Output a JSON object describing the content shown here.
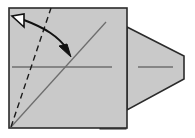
{
  "figure": {
    "canvas": {
      "width": 195,
      "height": 138,
      "background": "#ffffff"
    },
    "colors": {
      "paper_fill": "#c9c9c9",
      "paper_fill_light": "#cfcfcf",
      "outline": "#2b2b2b",
      "crease_line": "#6e6e6e",
      "dashed_line": "#1a1a1a",
      "arrow_stroke": "#111111",
      "arrow_fill": "#ffffff",
      "shadow": "#8a8a8a"
    },
    "shapes": [
      {
        "name": "paper-square",
        "type": "rect",
        "label": "Main square sheet",
        "x": 9,
        "y": 8,
        "width": 118,
        "height": 120,
        "fill": "#c9c9c9",
        "stroke": "#2b2b2b",
        "stroke_width": 1.6
      },
      {
        "name": "paper-point-flap",
        "type": "polygon",
        "label": "Pointed flap extending right",
        "points": "127,27 184,56 184,79 127,110",
        "fill": "#c9c9c9",
        "stroke": "#2b2b2b",
        "stroke_width": 1.6
      },
      {
        "name": "bottom-tab",
        "type": "rect",
        "label": "Small tab along bottom edge",
        "x": 100,
        "y": 124,
        "width": 26,
        "height": 5,
        "fill": "#6e6e6e",
        "stroke": "#2b2b2b",
        "stroke_width": 1.0
      }
    ],
    "lines": [
      {
        "name": "horizontal-center-crease",
        "label": "Horizontal centre crease on square",
        "x1": 12,
        "y1": 67,
        "x2": 112,
        "y2": 67,
        "stroke": "#6e6e6e",
        "stroke_width": 1.3,
        "style": "solid"
      },
      {
        "name": "flap-center-crease",
        "label": "Horizontal centre crease on flap",
        "x1": 138,
        "y1": 67,
        "x2": 173,
        "y2": 67,
        "stroke": "#6e6e6e",
        "stroke_width": 1.3,
        "style": "solid"
      },
      {
        "name": "diagonal-crease",
        "label": "Solid diagonal crease bottom-left to top-right",
        "x1": 11,
        "y1": 127,
        "x2": 106,
        "y2": 22,
        "stroke": "#6e6e6e",
        "stroke_width": 1.3,
        "style": "solid"
      },
      {
        "name": "dashed-fold-line",
        "label": "Dashed valley fold line",
        "x1": 11,
        "y1": 127,
        "x2": 51,
        "y2": 8,
        "stroke": "#1a1a1a",
        "stroke_width": 1.4,
        "style": "dashed",
        "dash_pattern": "6 4"
      }
    ],
    "arrow": {
      "name": "fold-direction-arrow",
      "label": "Curved fold arrow from dashed line to diagonal crease",
      "path": "M 24,20 C 45,28 58,36 68,50",
      "stroke": "#111111",
      "stroke_width": 2.0,
      "head_start": {
        "name": "hollow-arrowhead",
        "type": "open-triangle",
        "points": "24,14 24,27 12,16",
        "fill": "#ffffff",
        "stroke": "#111111",
        "stroke_width": 1.6
      },
      "head_end": {
        "name": "solid-arrowhead",
        "type": "filled-triangle",
        "points": "71,57 59,46 67,44",
        "fill": "#111111",
        "stroke": "#111111",
        "stroke_width": 1.0
      }
    }
  }
}
